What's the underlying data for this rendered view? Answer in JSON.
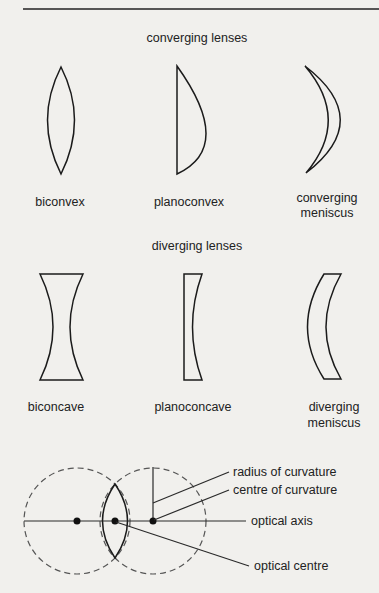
{
  "diagram": {
    "converging_title": "converging lenses",
    "diverging_title": "diverging lenses",
    "converging": [
      {
        "label_line1": "biconvex",
        "label_line2": ""
      },
      {
        "label_line1": "planoconvex",
        "label_line2": ""
      },
      {
        "label_line1": "converging",
        "label_line2": "meniscus"
      }
    ],
    "diverging": [
      {
        "label_line1": "biconcave",
        "label_line2": ""
      },
      {
        "label_line1": "planoconcave",
        "label_line2": ""
      },
      {
        "label_line1": "diverging",
        "label_line2": "meniscus"
      }
    ],
    "annotations": {
      "radius": "radius of curvature",
      "centre": "centre of curvature",
      "axis": "optical axis",
      "optical_centre": "optical centre"
    }
  },
  "colors": {
    "background": "#f1f0ed",
    "ink": "#1b1b1b"
  }
}
